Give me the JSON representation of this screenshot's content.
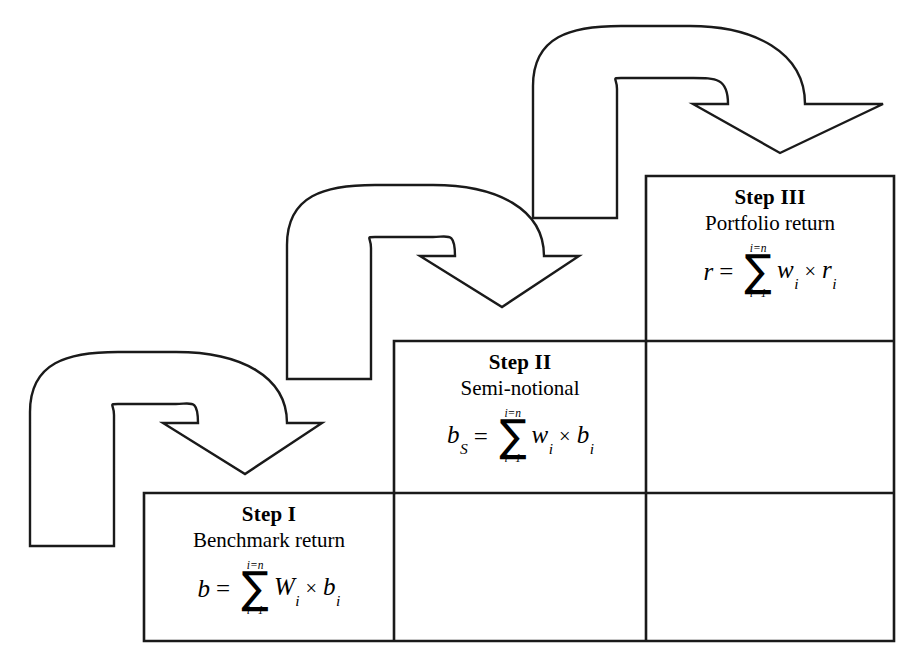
{
  "diagram": {
    "type": "process-staircase",
    "background_color": "#ffffff",
    "line_color": "#1a1a1a",
    "grid": {
      "columns_x": [
        144,
        394,
        646,
        894
      ],
      "rows_y": [
        176,
        341,
        493,
        641
      ]
    },
    "steps": [
      {
        "id": "step-1",
        "title": "Step I",
        "subtitle": "Benchmark return",
        "formula": {
          "lhs": "b",
          "lhs_sub": "",
          "equals": "=",
          "sum_upper": "i=n",
          "sum_lower": "i=1",
          "sigma": "∑",
          "factor1": "W",
          "factor1_sub": "i",
          "times": "×",
          "factor2": "b",
          "factor2_sub": "i",
          "plain": "b = ∑(i=1 to i=n) Wᵢ × bᵢ"
        }
      },
      {
        "id": "step-2",
        "title": "Step II",
        "subtitle": "Semi-notional",
        "formula": {
          "lhs": "b",
          "lhs_sub": "S",
          "equals": "=",
          "sum_upper": "i=n",
          "sum_lower": "i=1",
          "sigma": "∑",
          "factor1": "w",
          "factor1_sub": "i",
          "times": "×",
          "factor2": "b",
          "factor2_sub": "i",
          "plain": "bₛ = ∑(i=1 to i=n) wᵢ × bᵢ"
        }
      },
      {
        "id": "step-3",
        "title": "Step III",
        "subtitle": "Portfolio return",
        "formula": {
          "lhs": "r",
          "lhs_sub": "",
          "equals": "=",
          "sum_upper": "i=n",
          "sum_lower": "i=1",
          "sigma": "∑",
          "factor1": "w",
          "factor1_sub": "i",
          "times": "×",
          "factor2": "r",
          "factor2_sub": "i",
          "plain": "r = ∑(i=1 to i=n) wᵢ × rᵢ"
        }
      }
    ],
    "arrows": [
      {
        "id": "arrow-1",
        "label": "u-turn-arrow-into-step-1",
        "points_to": "Step I"
      },
      {
        "id": "arrow-2",
        "label": "u-turn-arrow-into-step-2",
        "points_to": "Step II"
      },
      {
        "id": "arrow-3",
        "label": "u-turn-arrow-into-step-3",
        "points_to": "Step III"
      }
    ]
  }
}
